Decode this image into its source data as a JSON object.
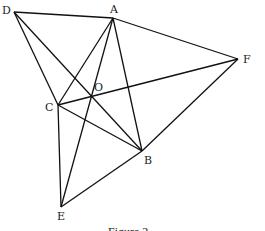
{
  "figure": {
    "caption": "Figure 2",
    "points": [
      {
        "id": "D",
        "label": "D",
        "x": 14,
        "y": 12,
        "lx": 2,
        "ly": 14
      },
      {
        "id": "A",
        "label": "A",
        "x": 113,
        "y": 18,
        "lx": 110,
        "ly": 13
      },
      {
        "id": "F",
        "label": "F",
        "x": 238,
        "y": 59,
        "lx": 243,
        "ly": 63
      },
      {
        "id": "C",
        "label": "C",
        "x": 58,
        "y": 105,
        "lx": 45,
        "ly": 111
      },
      {
        "id": "O",
        "label": "O",
        "x": 91,
        "y": 97,
        "lx": 94,
        "ly": 91
      },
      {
        "id": "B",
        "label": "B",
        "x": 142,
        "y": 151,
        "lx": 144,
        "ly": 164
      },
      {
        "id": "E",
        "label": "E",
        "x": 61,
        "y": 207,
        "lx": 57,
        "ly": 220
      }
    ],
    "segments": [
      [
        "D",
        "A"
      ],
      [
        "A",
        "F"
      ],
      [
        "F",
        "B"
      ],
      [
        "B",
        "E"
      ],
      [
        "E",
        "C"
      ],
      [
        "C",
        "D"
      ],
      [
        "D",
        "B"
      ],
      [
        "A",
        "C"
      ],
      [
        "A",
        "B"
      ],
      [
        "A",
        "E"
      ],
      [
        "C",
        "F"
      ],
      [
        "C",
        "B"
      ]
    ],
    "line_color": "#111111"
  }
}
